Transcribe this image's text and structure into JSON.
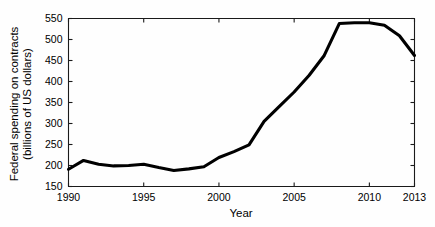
{
  "chart_data": {
    "type": "line",
    "title": "",
    "xlabel": "Year",
    "ylabel": "Federal spending on contracts (billions of US dollars)",
    "ylabel_line1": "Federal spending on contracts",
    "ylabel_line2": "(billions of US dollars)",
    "xlim": [
      1990,
      2013
    ],
    "ylim": [
      150,
      550
    ],
    "grid": false,
    "legend": null,
    "x_ticks": [
      1990,
      1995,
      2000,
      2005,
      2010,
      2013
    ],
    "x_tick_labels": [
      "1990",
      "1995",
      "2000",
      "2005",
      "2010",
      "2013"
    ],
    "y_ticks": [
      150,
      200,
      250,
      300,
      350,
      400,
      450,
      500,
      550
    ],
    "y_tick_labels": [
      "150",
      "200",
      "250",
      "300",
      "350",
      "400",
      "450",
      "500",
      "550"
    ],
    "x": [
      1990,
      1991,
      1992,
      1993,
      1994,
      1995,
      1996,
      1997,
      1998,
      1999,
      2000,
      2001,
      2002,
      2003,
      2004,
      2005,
      2006,
      2007,
      2008,
      2009,
      2010,
      2011,
      2012,
      2013
    ],
    "values": [
      191,
      212,
      203,
      199,
      200,
      203,
      195,
      188,
      192,
      197,
      219,
      233,
      249,
      305,
      340,
      375,
      415,
      462,
      538,
      540,
      540,
      534,
      509,
      462
    ],
    "series": [
      {
        "name": "Federal spending on contracts",
        "values": [
          191,
          212,
          203,
          199,
          200,
          203,
          195,
          188,
          192,
          197,
          219,
          233,
          249,
          305,
          340,
          375,
          415,
          462,
          538,
          540,
          540,
          534,
          509,
          462
        ],
        "color": "#000000",
        "line_width": 3
      }
    ],
    "units": "billions of US dollars",
    "colors": {
      "line": "#000000",
      "axis": "#1a1a1a",
      "background": "#fefefe",
      "text": "#000000"
    }
  }
}
